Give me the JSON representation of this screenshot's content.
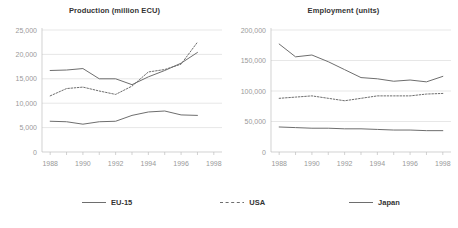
{
  "chart_data": [
    {
      "type": "line",
      "title": "Production (million ECU)",
      "xlabel": "",
      "ylabel": "",
      "xlim": [
        1987.5,
        1998.5
      ],
      "ylim": [
        0,
        25000
      ],
      "yticks": [
        0,
        5000,
        10000,
        15000,
        20000,
        25000
      ],
      "ytick_labels": [
        "0",
        "5,000",
        "10,000",
        "15,000",
        "20,000",
        "25,000"
      ],
      "xticks": [
        1988,
        1990,
        1992,
        1994,
        1996,
        1998
      ],
      "xtick_labels": [
        "1988",
        "1990",
        "1992",
        "1994",
        "1996",
        "1998"
      ],
      "x_minor_ticks": [
        1988,
        1989,
        1990,
        1991,
        1992,
        1993,
        1994,
        1995,
        1996,
        1997,
        1998
      ],
      "grid": "horizontal",
      "legend_position": "below-figure",
      "x": [
        1988,
        1989,
        1990,
        1991,
        1992,
        1993,
        1994,
        1995,
        1996,
        1997
      ],
      "series": [
        {
          "name": "EU-15",
          "style": "solid",
          "color": "#6e6e6e",
          "values": [
            16700,
            16800,
            17100,
            15000,
            15000,
            13800,
            15400,
            16700,
            18200,
            20400
          ]
        },
        {
          "name": "USA",
          "style": "dotted",
          "color": "#6e6e6e",
          "values": [
            11500,
            13000,
            13300,
            12500,
            11800,
            13500,
            16400,
            16900,
            18000,
            22500
          ]
        },
        {
          "name": "Japan",
          "style": "solid",
          "color": "#6e6e6e",
          "values": [
            6300,
            6200,
            5700,
            6200,
            6300,
            7500,
            8200,
            8400,
            7600,
            7500
          ]
        }
      ]
    },
    {
      "type": "line",
      "title": "Employment (units)",
      "xlabel": "",
      "ylabel": "",
      "xlim": [
        1987.5,
        1998.5
      ],
      "ylim": [
        0,
        200000
      ],
      "yticks": [
        0,
        50000,
        100000,
        150000,
        200000
      ],
      "ytick_labels": [
        "0",
        "50,000",
        "100,000",
        "150,000",
        "200,000"
      ],
      "xticks": [
        1988,
        1990,
        1992,
        1994,
        1996,
        1998
      ],
      "xtick_labels": [
        "1988",
        "1990",
        "1992",
        "1994",
        "1996",
        "1998"
      ],
      "x_minor_ticks": [
        1988,
        1989,
        1990,
        1991,
        1992,
        1993,
        1994,
        1995,
        1996,
        1997,
        1998
      ],
      "grid": "horizontal",
      "legend_position": "below-figure",
      "x": [
        1988,
        1989,
        1990,
        1991,
        1992,
        1993,
        1994,
        1995,
        1996,
        1997,
        1998
      ],
      "series": [
        {
          "name": "EU-15",
          "style": "solid",
          "color": "#6e6e6e",
          "values": [
            177000,
            156000,
            159000,
            148000,
            135000,
            122000,
            120000,
            116000,
            118000,
            115000,
            124000
          ]
        },
        {
          "name": "USA",
          "style": "dotted",
          "color": "#6e6e6e",
          "values": [
            88000,
            90000,
            92000,
            88000,
            84000,
            88000,
            92000,
            92000,
            92000,
            95000,
            96000
          ]
        },
        {
          "name": "Japan",
          "style": "solid",
          "color": "#6e6e6e",
          "values": [
            41000,
            40000,
            39000,
            39000,
            38000,
            38000,
            37000,
            36000,
            36000,
            35000,
            35000
          ]
        }
      ]
    }
  ],
  "legend": {
    "items": [
      {
        "label": "EU-15",
        "style": "solid"
      },
      {
        "label": "USA",
        "style": "dotted"
      },
      {
        "label": "Japan",
        "style": "solid"
      }
    ]
  },
  "style": {
    "line_color": "#6e6e6e",
    "grid_color": "#dcdcdc",
    "axis_color": "#bfbfbf",
    "tick_label_color": "#999999",
    "title_color": "#333333",
    "background": "#ffffff"
  }
}
